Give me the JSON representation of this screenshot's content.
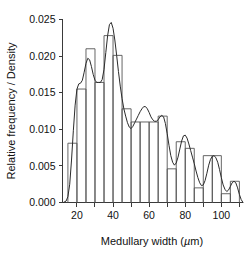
{
  "chart_data": {
    "type": "bar",
    "title": "",
    "xlabel": "Medullary width (µm)",
    "ylabel": "Relative frequency / Density",
    "xlim": [
      12,
      112
    ],
    "ylim": [
      0.0,
      0.025
    ],
    "grid": false,
    "legend": "none",
    "bin_width": 5,
    "xticks": [
      20,
      30,
      40,
      50,
      60,
      70,
      80,
      90,
      100,
      110
    ],
    "xtick_labels_shown": [
      "20",
      "40",
      "60",
      "80",
      "100"
    ],
    "yticks": [
      0.0,
      0.005,
      0.01,
      0.015,
      0.02,
      0.025
    ],
    "ytick_labels": [
      "0.000",
      "0.005",
      "0.010",
      "0.015",
      "0.020",
      "0.025"
    ],
    "bin_edges": [
      15,
      20,
      25,
      30,
      35,
      40,
      45,
      50,
      55,
      60,
      65,
      70,
      75,
      80,
      85,
      90,
      95,
      100,
      105,
      110
    ],
    "categories": [
      "15-20",
      "20-25",
      "25-30",
      "30-35",
      "35-40",
      "40-45",
      "45-50",
      "50-55",
      "55-60",
      "60-65",
      "65-70",
      "70-75",
      "75-80",
      "80-85",
      "85-90",
      "90-95",
      "95-100",
      "100-105",
      "105-110"
    ],
    "values": [
      0.0081,
      0.0155,
      0.021,
      0.0164,
      0.0228,
      0.0201,
      0.0128,
      0.011,
      0.011,
      0.011,
      0.0118,
      0.0046,
      0.0083,
      0.0074,
      0.002,
      0.0064,
      0.0064,
      0.0012,
      0.0029
    ],
    "series": [
      {
        "name": "Relative frequency",
        "type": "bar",
        "values": [
          0.0081,
          0.0155,
          0.021,
          0.0164,
          0.0228,
          0.0201,
          0.0128,
          0.011,
          0.011,
          0.011,
          0.0118,
          0.0046,
          0.0083,
          0.0074,
          0.002,
          0.0064,
          0.0064,
          0.0012,
          0.0029
        ]
      },
      {
        "name": "Density",
        "type": "line",
        "x": [
          12.5,
          14,
          15,
          16,
          17,
          18,
          19,
          20,
          21,
          22,
          23,
          24,
          25,
          26,
          27,
          28,
          29,
          30,
          31,
          32,
          33,
          34,
          35,
          36,
          37,
          38,
          39,
          40,
          41,
          42,
          43,
          44,
          45,
          46,
          47,
          48,
          49,
          50,
          51,
          52,
          53,
          54,
          55,
          56,
          57,
          58,
          59,
          60,
          61,
          62,
          63,
          64,
          65,
          66,
          67,
          68,
          69,
          70,
          71,
          72,
          73,
          74,
          75,
          76,
          77,
          78,
          79,
          80,
          81,
          82,
          83,
          84,
          85,
          86,
          87,
          88,
          89,
          90,
          91,
          92,
          93,
          94,
          95,
          96,
          97,
          98,
          99,
          100,
          101,
          102,
          103,
          104,
          105,
          106,
          107,
          108,
          109,
          110,
          111,
          112
        ],
        "y": [
          0.0,
          0.0002,
          0.0008,
          0.0025,
          0.0058,
          0.0098,
          0.0133,
          0.0155,
          0.0162,
          0.0163,
          0.0167,
          0.0178,
          0.019,
          0.0197,
          0.0195,
          0.0186,
          0.0175,
          0.0167,
          0.0164,
          0.0164,
          0.0164,
          0.0168,
          0.0182,
          0.0205,
          0.0228,
          0.0243,
          0.0246,
          0.0238,
          0.0222,
          0.0201,
          0.0179,
          0.0159,
          0.0142,
          0.0128,
          0.0118,
          0.0109,
          0.0103,
          0.0101,
          0.0104,
          0.0109,
          0.0114,
          0.0119,
          0.0124,
          0.0128,
          0.0131,
          0.0131,
          0.0128,
          0.0123,
          0.0117,
          0.0113,
          0.0111,
          0.0111,
          0.0113,
          0.0117,
          0.0119,
          0.0117,
          0.0108,
          0.0094,
          0.0078,
          0.0064,
          0.0055,
          0.0051,
          0.0054,
          0.0062,
          0.0073,
          0.0084,
          0.0091,
          0.0092,
          0.0088,
          0.008,
          0.0071,
          0.0062,
          0.0053,
          0.0043,
          0.0034,
          0.0027,
          0.0023,
          0.0024,
          0.003,
          0.004,
          0.0051,
          0.0059,
          0.0063,
          0.0064,
          0.0061,
          0.0055,
          0.0045,
          0.0034,
          0.0024,
          0.0018,
          0.0015,
          0.0017,
          0.0022,
          0.0027,
          0.0029,
          0.0027,
          0.002,
          0.0011,
          0.0004,
          0.0
        ]
      }
    ]
  }
}
